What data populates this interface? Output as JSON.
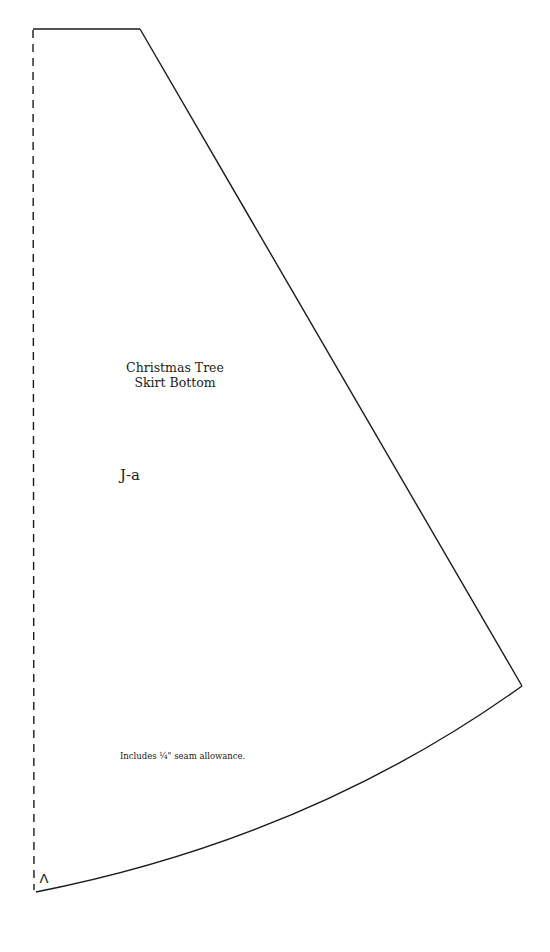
{
  "pattern": {
    "title_line1": "Christmas Tree",
    "title_line2": "Skirt Bottom",
    "piece_id": "J-a",
    "seam_note": "Includes ¼\" seam allowance.",
    "corner_mark": "Λ",
    "line_color": "#1a1a1a",
    "fold_line_style": "dashed"
  }
}
